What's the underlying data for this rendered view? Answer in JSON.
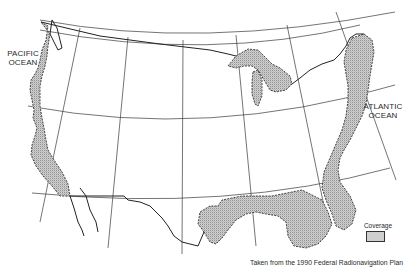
{
  "map": {
    "type": "coverage-map",
    "region": "Continental United States",
    "labels": {
      "pacific": [
        "PACIFIC",
        "OCEAN"
      ],
      "atlantic": [
        "ATLANTIC",
        "OCEAN"
      ]
    },
    "legend": {
      "title": "Coverage",
      "swatch": "stippled-gray"
    },
    "credit": "Taken from the 1990 Federal Radionavigation Plan",
    "colors": {
      "outline": "#2a2a2a",
      "coverage_fill": "#cfcfcf",
      "graticule": "#3a3a3a",
      "background": "#ffffff"
    },
    "coverage_areas": [
      "West Coast",
      "Great Lakes",
      "East Coast",
      "Gulf Coast"
    ]
  }
}
